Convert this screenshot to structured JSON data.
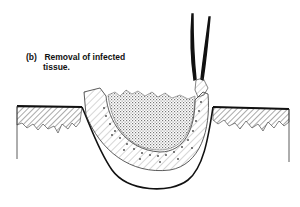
{
  "figure": {
    "panel_label": "(b)",
    "caption_line1": "Removal of infected",
    "caption_line2": "tissue.",
    "elements": [
      "forceps",
      "skin-surface-left",
      "skin-surface-right",
      "wound-cavity",
      "infected-tissue-layer",
      "necrotic-core"
    ]
  },
  "colors": {
    "ink": "#111111",
    "hatch": "#555555",
    "stipple": "#777777",
    "background": "#ffffff"
  }
}
